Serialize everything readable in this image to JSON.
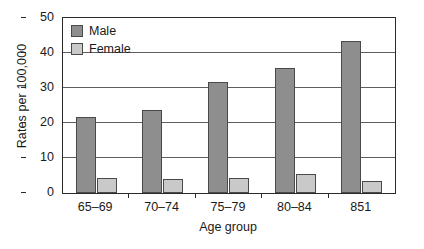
{
  "chart_data": {
    "type": "bar",
    "title": "",
    "xlabel": "Age group",
    "ylabel": "Rates per 100,000",
    "categories": [
      "65–69",
      "70–74",
      "75–79",
      "80–84",
      "851"
    ],
    "series": [
      {
        "name": "Male",
        "color": "#8e8e8e",
        "values": [
          21.8,
          23.6,
          31.6,
          35.7,
          43.3
        ]
      },
      {
        "name": "Female",
        "color": "#c9c9c9",
        "values": [
          4.3,
          4.0,
          4.2,
          5.5,
          3.3
        ]
      }
    ],
    "ylim": [
      0,
      50
    ],
    "yticks": [
      0,
      10,
      20,
      30,
      40,
      50
    ],
    "ytick_labels": [
      "0",
      "10",
      "20",
      "30",
      "40",
      "50"
    ],
    "grid": true,
    "legend_position": "top-left-inside"
  },
  "legend": {
    "items": [
      {
        "label": "Male",
        "color": "#8e8e8e"
      },
      {
        "label": "Female",
        "color": "#c9c9c9"
      }
    ]
  },
  "axes": {
    "y_title": "Rates per 100,000",
    "x_title": "Age group"
  }
}
